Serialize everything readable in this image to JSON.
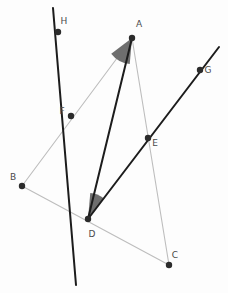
{
  "figure": {
    "width": 228,
    "height": 293,
    "background_color": "#fdfdfd"
  },
  "colors": {
    "dark_line": "#1c1c1c",
    "light_line": "#bdbdbd",
    "point_fill": "#2b2b2b",
    "angle_fill": "#6e6e6e",
    "label_text": "#4a4a4a"
  },
  "points": [
    {
      "id": "A",
      "label": "A",
      "x": 132,
      "y": 38,
      "label_x": 139,
      "label_y": 27
    },
    {
      "id": "B",
      "label": "B",
      "x": 22,
      "y": 186,
      "label_x": 13,
      "label_y": 180
    },
    {
      "id": "C",
      "label": "C",
      "x": 169,
      "y": 265,
      "label_x": 175,
      "label_y": 258
    },
    {
      "id": "D",
      "label": "D",
      "x": 88,
      "y": 219,
      "label_x": 92,
      "label_y": 237
    },
    {
      "id": "E",
      "label": "E",
      "x": 148,
      "y": 138,
      "label_x": 155,
      "label_y": 146
    },
    {
      "id": "F",
      "label": "F",
      "x": 71,
      "y": 116,
      "label_x": 62,
      "label_y": 114
    },
    {
      "id": "G",
      "label": "G",
      "x": 200,
      "y": 70,
      "label_x": 208,
      "label_y": 73
    },
    {
      "id": "H",
      "label": "H",
      "x": 58,
      "y": 32,
      "label_x": 64,
      "label_y": 24
    }
  ],
  "segments": [
    {
      "id": "BA",
      "from": "B",
      "to": "A",
      "style": "light",
      "label": "segment-b-a"
    },
    {
      "id": "BC",
      "from": "B",
      "to": "C",
      "style": "light",
      "label": "segment-b-c"
    },
    {
      "id": "AC",
      "from": "A",
      "to": "C",
      "style": "light",
      "label": "segment-a-c"
    },
    {
      "id": "DA",
      "from": "D",
      "to": "A",
      "style": "dark",
      "label": "segment-d-a"
    }
  ],
  "lines": [
    {
      "id": "HD",
      "label": "line-h-d-extended",
      "style": "dark",
      "x1": 53,
      "y1": 8,
      "x2": 76,
      "y2": 285
    },
    {
      "id": "DG",
      "label": "ray-d-e-g",
      "style": "dark",
      "x1": 88,
      "y1": 219,
      "x2": 219,
      "y2": 47
    }
  ],
  "angles": [
    {
      "id": "angle-at-A",
      "vertex": "A",
      "fill": "#6e6e6e",
      "radius": 26,
      "start_deg": 95,
      "end_deg": 143
    },
    {
      "id": "angle-at-D",
      "vertex": "D",
      "fill": "#6e6e6e",
      "radius": 26,
      "start_deg": -53,
      "end_deg": -85
    }
  ]
}
